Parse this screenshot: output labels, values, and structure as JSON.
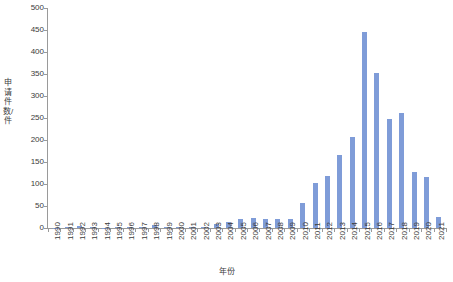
{
  "chart_data": {
    "type": "bar",
    "title": "",
    "xlabel": "年份",
    "ylabel": "申请件数/件",
    "ylim": [
      0,
      500
    ],
    "yticks": [
      0,
      50,
      100,
      150,
      200,
      250,
      300,
      350,
      400,
      450,
      500
    ],
    "grid": false,
    "legend": false,
    "series_color": "#7f9cd8",
    "categories": [
      "1990",
      "1991",
      "1992",
      "1993",
      "1994",
      "1995",
      "1996",
      "1997",
      "1998",
      "1999",
      "2000",
      "2001",
      "2002",
      "2003",
      "2004",
      "2005",
      "2006",
      "2007",
      "2008",
      "2009",
      "2010",
      "2011",
      "2012",
      "2013",
      "2014",
      "2015",
      "2016",
      "2017",
      "2018",
      "2019",
      "2020",
      "2021"
    ],
    "values": [
      1,
      2,
      5,
      2,
      1,
      2,
      3,
      3,
      6,
      3,
      3,
      2,
      2,
      9,
      13,
      20,
      22,
      20,
      20,
      20,
      57,
      102,
      119,
      167,
      207,
      445,
      353,
      248,
      262,
      128,
      115,
      25
    ]
  }
}
